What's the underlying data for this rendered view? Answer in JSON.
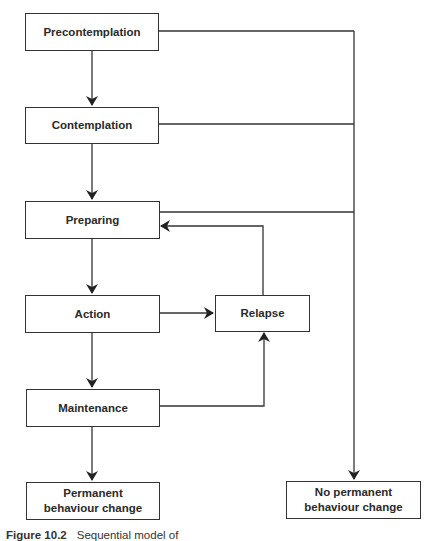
{
  "diagram": {
    "stages": {
      "precontemplation": "Precontemplation",
      "contemplation": "Contemplation",
      "preparing": "Preparing",
      "action": "Action",
      "relapse": "Relapse",
      "maintenance": "Maintenance",
      "permanent_line1": "Permanent",
      "permanent_line2": "behaviour change",
      "no_permanent_line1": "No permanent",
      "no_permanent_line2": "behaviour change"
    },
    "edges": [
      {
        "from": "Precontemplation",
        "to": "Contemplation"
      },
      {
        "from": "Contemplation",
        "to": "Preparing"
      },
      {
        "from": "Preparing",
        "to": "Action"
      },
      {
        "from": "Action",
        "to": "Relapse"
      },
      {
        "from": "Action",
        "to": "Maintenance"
      },
      {
        "from": "Maintenance",
        "to": "Relapse"
      },
      {
        "from": "Maintenance",
        "to": "Permanent behaviour change"
      },
      {
        "from": "Relapse",
        "to": "Preparing"
      },
      {
        "from": "Precontemplation",
        "to": "No permanent behaviour change"
      },
      {
        "from": "Contemplation",
        "to": "No permanent behaviour change"
      },
      {
        "from": "Preparing",
        "to": "No permanent behaviour change"
      }
    ],
    "colors": {
      "line": "#333333",
      "background": "#ffffff"
    }
  },
  "caption": {
    "label": "Figure 10.2",
    "text": "Sequential model of"
  }
}
